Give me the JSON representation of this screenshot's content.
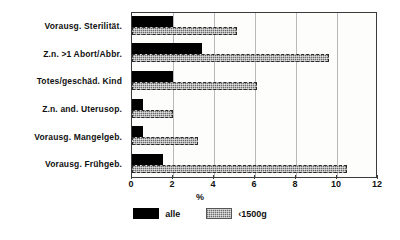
{
  "chart_data": {
    "type": "bar",
    "orientation": "horizontal",
    "title": "",
    "xlabel": "%",
    "ylabel": "",
    "xlim": [
      0,
      12
    ],
    "xticks": [
      0,
      2,
      4,
      6,
      8,
      10,
      12
    ],
    "grid": true,
    "legend_position": "bottom",
    "categories": [
      "Vorausg. Sterilität.",
      "Z.n. >1 Abort/Abbr.",
      "Totes/geschäd. Kind",
      "Z.n. and. Uterusop.",
      "Vorausg. Mangelgeb.",
      "Vorausg. Frühgeb."
    ],
    "series": [
      {
        "name": "alle",
        "color": "#000000",
        "values": [
          2.0,
          3.4,
          2.0,
          0.55,
          0.55,
          1.5
        ]
      },
      {
        "name": "<1500g",
        "color": "#9a9a9a",
        "values": [
          5.1,
          9.6,
          6.1,
          2.0,
          3.2,
          10.5
        ]
      }
    ]
  },
  "legend": {
    "items": [
      {
        "label": "alle"
      },
      {
        "label": "‹1500g"
      }
    ]
  },
  "axis": {
    "x_unit_label": "%"
  }
}
